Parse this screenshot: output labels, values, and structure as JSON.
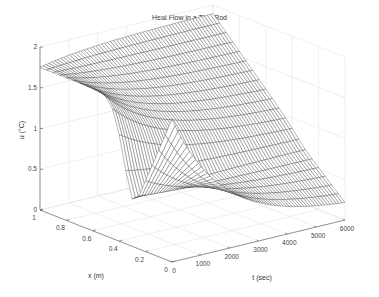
{
  "chart_data": {
    "type": "surface",
    "title": "Heat Flow in a Thin Rod",
    "xlabel": "x (m)",
    "ylabel": "t (sec)",
    "zlabel": "u (°C)",
    "x_ticks": [
      "0",
      "0.2",
      "0.4",
      "0.6",
      "0.8",
      "1"
    ],
    "t_ticks": [
      "0",
      "1000",
      "2000",
      "3000",
      "4000",
      "5000",
      "6000"
    ],
    "z_ticks": [
      "0",
      "0.5",
      "1",
      "1.5",
      "2"
    ],
    "xlim": [
      0,
      1
    ],
    "tlim": [
      0,
      6000
    ],
    "zlim": [
      0,
      2
    ],
    "grid": true,
    "mesh": {
      "nx": 21,
      "nt": 60
    }
  }
}
